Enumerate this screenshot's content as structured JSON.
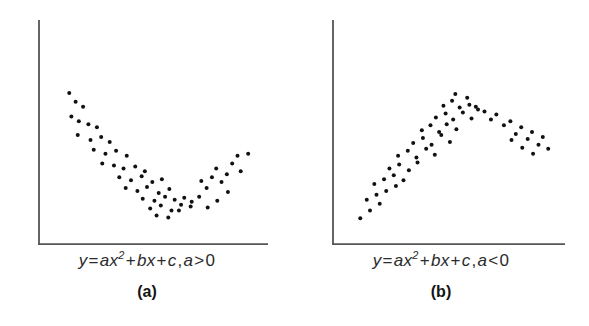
{
  "figure": {
    "background_color": "#ffffff",
    "axis_color": "#555555",
    "point_color": "#111111",
    "panels": [
      {
        "id": "a",
        "label": "(a)",
        "equation_text": "y = ax2 + bx + c, a > 0",
        "equation_parts": {
          "lhs": "y",
          "eq": "=",
          "term1_coef": "a",
          "term1_var": "x",
          "term1_exp": "2",
          "plus1": "+",
          "term2_coef": "b",
          "term2_var": "x",
          "plus2": "+",
          "term3": "c",
          "comma": ",",
          "cond_var": "a",
          "cond_op": ">",
          "cond_val": "0"
        },
        "chart_data": {
          "type": "scatter",
          "title": "y = ax2 + bx + c, a > 0",
          "subtitle": "(a)",
          "xlabel": "",
          "ylabel": "",
          "xlim": [
            0,
            100
          ],
          "ylim": [
            0,
            100
          ],
          "grid": false,
          "legend": "none",
          "axis_spines": [
            "left",
            "bottom"
          ],
          "ticks": false,
          "tick_labels": [],
          "annotation": "U-shaped (upward-opening) parabolic scatter; a > 0",
          "curve_form": "quadratic",
          "curve_direction": "opens upward",
          "n_points": 58,
          "points": [
            [
              9.5,
              73.0
            ],
            [
              12.5,
              68.5
            ],
            [
              16.0,
              66.0
            ],
            [
              10.5,
              61.0
            ],
            [
              14.0,
              58.5
            ],
            [
              18.5,
              57.0
            ],
            [
              22.5,
              55.5
            ],
            [
              13.5,
              51.5
            ],
            [
              19.5,
              49.0
            ],
            [
              24.5,
              50.5
            ],
            [
              28.5,
              48.0
            ],
            [
              21.0,
              44.0
            ],
            [
              26.5,
              42.0
            ],
            [
              31.5,
              43.5
            ],
            [
              36.5,
              41.0
            ],
            [
              25.0,
              37.0
            ],
            [
              30.5,
              36.0
            ],
            [
              35.0,
              34.5
            ],
            [
              40.5,
              35.5
            ],
            [
              45.0,
              33.0
            ],
            [
              33.0,
              30.0
            ],
            [
              38.5,
              28.5
            ],
            [
              43.5,
              30.5
            ],
            [
              48.5,
              27.5
            ],
            [
              53.0,
              29.0
            ],
            [
              36.0,
              24.5
            ],
            [
              41.5,
              23.0
            ],
            [
              46.0,
              25.0
            ],
            [
              51.5,
              22.0
            ],
            [
              56.5,
              24.0
            ],
            [
              44.0,
              19.0
            ],
            [
              49.5,
              18.0
            ],
            [
              54.5,
              20.0
            ],
            [
              59.0,
              18.5
            ],
            [
              63.5,
              19.5
            ],
            [
              47.5,
              14.0
            ],
            [
              52.5,
              15.5
            ],
            [
              57.5,
              13.0
            ],
            [
              62.0,
              16.0
            ],
            [
              67.0,
              17.5
            ],
            [
              50.5,
              10.5
            ],
            [
              56.0,
              9.5
            ],
            [
              61.0,
              13.0
            ],
            [
              66.5,
              15.0
            ],
            [
              70.5,
              20.0
            ],
            [
              74.0,
              24.5
            ],
            [
              71.5,
              28.0
            ],
            [
              76.5,
              30.0
            ],
            [
              78.5,
              34.5
            ],
            [
              81.0,
              27.5
            ],
            [
              83.5,
              31.5
            ],
            [
              86.0,
              37.0
            ],
            [
              88.5,
              41.0
            ],
            [
              90.0,
              33.0
            ],
            [
              93.5,
              42.0
            ],
            [
              84.0,
              22.5
            ],
            [
              79.0,
              18.0
            ],
            [
              74.5,
              14.5
            ]
          ]
        }
      },
      {
        "id": "b",
        "label": "(b)",
        "equation_text": "y = ax2 + bx + c, a < 0",
        "equation_parts": {
          "lhs": "y",
          "eq": "=",
          "term1_coef": "a",
          "term1_var": "x",
          "term1_exp": "2",
          "plus1": "+",
          "term2_coef": "b",
          "term2_var": "x",
          "plus2": "+",
          "term3": "c",
          "comma": ",",
          "cond_var": "a",
          "cond_op": "<",
          "cond_val": "0"
        },
        "chart_data": {
          "type": "scatter",
          "title": "y = ax2 + bx + c, a < 0",
          "subtitle": "(b)",
          "xlabel": "",
          "ylabel": "",
          "xlim": [
            0,
            100
          ],
          "ylim": [
            0,
            100
          ],
          "grid": false,
          "legend": "none",
          "axis_spines": [
            "left",
            "bottom"
          ],
          "ticks": false,
          "tick_labels": [],
          "annotation": "Inverted U-shaped (downward-opening) parabolic scatter; a < 0",
          "curve_form": "quadratic",
          "curve_direction": "opens downward",
          "n_points": 58,
          "points": [
            [
              8.0,
              9.0
            ],
            [
              12.5,
              13.0
            ],
            [
              17.0,
              16.5
            ],
            [
              11.0,
              18.5
            ],
            [
              15.5,
              21.0
            ],
            [
              20.0,
              23.0
            ],
            [
              24.5,
              25.5
            ],
            [
              14.5,
              26.5
            ],
            [
              19.0,
              29.0
            ],
            [
              23.5,
              31.0
            ],
            [
              28.0,
              28.5
            ],
            [
              21.5,
              34.5
            ],
            [
              26.0,
              36.5
            ],
            [
              30.5,
              33.5
            ],
            [
              34.5,
              37.5
            ],
            [
              25.5,
              41.0
            ],
            [
              30.0,
              43.5
            ],
            [
              34.0,
              40.0
            ],
            [
              38.5,
              44.5
            ],
            [
              42.5,
              41.5
            ],
            [
              32.5,
              47.5
            ],
            [
              37.0,
              50.0
            ],
            [
              41.0,
              46.5
            ],
            [
              45.5,
              51.5
            ],
            [
              49.5,
              48.0
            ],
            [
              36.5,
              54.0
            ],
            [
              40.5,
              56.5
            ],
            [
              44.5,
              53.0
            ],
            [
              48.0,
              57.0
            ],
            [
              52.5,
              54.5
            ],
            [
              43.0,
              60.5
            ],
            [
              47.5,
              62.5
            ],
            [
              51.0,
              59.5
            ],
            [
              55.5,
              63.0
            ],
            [
              59.5,
              60.0
            ],
            [
              46.5,
              66.5
            ],
            [
              50.5,
              69.0
            ],
            [
              54.0,
              65.5
            ],
            [
              58.5,
              67.0
            ],
            [
              62.5,
              64.5
            ],
            [
              52.0,
              72.5
            ],
            [
              57.5,
              70.5
            ],
            [
              61.5,
              66.0
            ],
            [
              65.5,
              63.5
            ],
            [
              68.5,
              59.5
            ],
            [
              71.0,
              62.0
            ],
            [
              74.5,
              56.5
            ],
            [
              77.5,
              58.5
            ],
            [
              80.0,
              52.0
            ],
            [
              82.5,
              55.5
            ],
            [
              85.5,
              49.5
            ],
            [
              87.5,
              53.0
            ],
            [
              90.5,
              46.5
            ],
            [
              92.5,
              50.5
            ],
            [
              95.0,
              44.5
            ],
            [
              88.0,
              42.0
            ],
            [
              83.0,
              45.0
            ],
            [
              78.0,
              49.0
            ]
          ]
        }
      }
    ]
  }
}
